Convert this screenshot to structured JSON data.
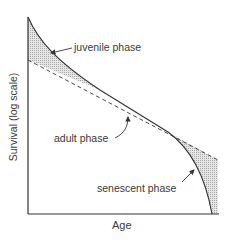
{
  "diagram": {
    "title": "",
    "x_axis_label": "Age",
    "y_axis_label": "Survival (log scale)",
    "labels": {
      "juvenile": "juvenile phase",
      "adult": "adult phase",
      "senescent": "senescent phase"
    },
    "elements": [
      {
        "type": "curve",
        "name": "survival-curve",
        "style": "solid"
      },
      {
        "type": "line",
        "name": "constant-mortality-line",
        "style": "dashed"
      },
      {
        "type": "shaded-region",
        "name": "juvenile-excess-mortality",
        "fill": "stippled"
      },
      {
        "type": "shaded-region",
        "name": "senescent-excess-mortality",
        "fill": "stippled"
      }
    ],
    "colors": {
      "line": "#333333",
      "shade": "#cfcfcf",
      "text": "#3a3a3a"
    }
  }
}
